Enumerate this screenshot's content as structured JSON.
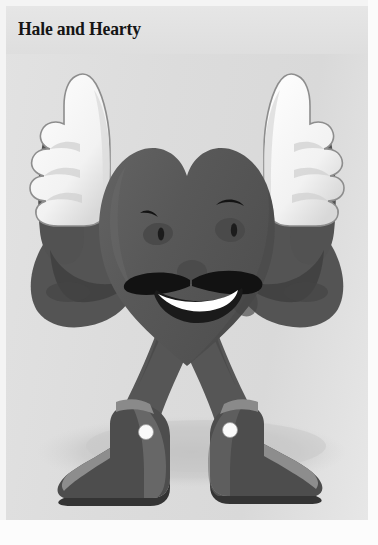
{
  "page": {
    "title": "Hale and Hearty",
    "background_color": "#dcdcdc",
    "page_border_color": "#f4f4f4",
    "title_color": "#151515"
  },
  "illustration": {
    "name": "heart-mascot",
    "description": "Grayscale cartoon heart character flexing both arms with thumbs-up gloves, wearing boots",
    "alt_text": "Hale and Hearty heart mascot giving two thumbs up",
    "palette": {
      "body_dark": "#5a5a5a",
      "body_shade": "#4c4c4c",
      "body_highlight": "#666666",
      "glove_white": "#fbfbfb",
      "glove_shade": "#e0e0e0",
      "glove_outline": "#7d7d7d",
      "boot_dark": "#4a4a4a",
      "boot_mid": "#616161",
      "boot_light": "#8e8e8e",
      "boot_sole": "#3b3b3b",
      "feature_black": "#111111",
      "teeth_white": "#ffffff",
      "ground_shadow": "#c6c6c6"
    },
    "parts": [
      {
        "name": "ground-shadow",
        "label": "Ground shadow"
      },
      {
        "name": "left-arm",
        "label": "Left flexed arm"
      },
      {
        "name": "right-arm",
        "label": "Right flexed arm"
      },
      {
        "name": "left-glove",
        "label": "Left thumbs-up glove"
      },
      {
        "name": "right-glove",
        "label": "Right thumbs-up glove"
      },
      {
        "name": "heart-body",
        "label": "Heart body"
      },
      {
        "name": "left-eye",
        "label": "Left eye"
      },
      {
        "name": "right-eye",
        "label": "Right eye"
      },
      {
        "name": "left-eyebrow",
        "label": "Left eyebrow"
      },
      {
        "name": "right-eyebrow",
        "label": "Right eyebrow"
      },
      {
        "name": "nose",
        "label": "Nose"
      },
      {
        "name": "mustache",
        "label": "Mustache"
      },
      {
        "name": "mouth",
        "label": "Smiling mouth"
      },
      {
        "name": "teeth",
        "label": "Teeth"
      },
      {
        "name": "left-leg",
        "label": "Left leg"
      },
      {
        "name": "right-leg",
        "label": "Right leg"
      },
      {
        "name": "left-boot",
        "label": "Left boot"
      },
      {
        "name": "right-boot",
        "label": "Right boot"
      },
      {
        "name": "left-boot-button",
        "label": "Left boot button"
      },
      {
        "name": "right-boot-button",
        "label": "Right boot button"
      }
    ]
  }
}
